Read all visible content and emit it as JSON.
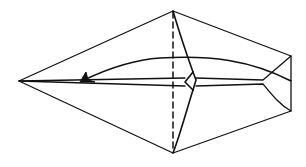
{
  "diagram": {
    "type": "origami-fold-step",
    "colors": {
      "stroke": "#111111",
      "background": "#ffffff"
    },
    "elements": [
      {
        "name": "outline",
        "kind": "polygon",
        "points": [
          [
            19,
            81
          ],
          [
            173,
            11
          ],
          [
            291,
            56
          ],
          [
            291,
            111
          ],
          [
            173,
            153
          ]
        ]
      },
      {
        "name": "fold-line-dashed",
        "kind": "dashed-line",
        "from": [
          173,
          11
        ],
        "to": [
          173,
          153
        ]
      },
      {
        "name": "center-flap",
        "kind": "crease-lines"
      },
      {
        "name": "fold-arrow",
        "kind": "curved-arrow",
        "from": [
          291,
          81
        ],
        "to": [
          80,
          82
        ]
      }
    ]
  }
}
